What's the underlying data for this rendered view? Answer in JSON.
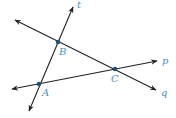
{
  "diagram": {
    "colors": {
      "line": "#222222",
      "label": "#4a8fc9",
      "point": "#1f4e7a"
    },
    "lines": [
      {
        "name": "t",
        "label": "t",
        "x1": 29,
        "y1": 111,
        "x2": 73,
        "y2": 7,
        "label_x": 77,
        "label_y": 8
      },
      {
        "name": "q",
        "label": "q",
        "x1": 15,
        "y1": 20,
        "x2": 156,
        "y2": 90,
        "label_x": 161,
        "label_y": 96
      },
      {
        "name": "p",
        "label": "p",
        "x1": 12,
        "y1": 89,
        "x2": 157,
        "y2": 61,
        "label_x": 162,
        "label_y": 64
      }
    ],
    "points": [
      {
        "name": "A",
        "label": "A",
        "x": 39,
        "y": 84,
        "label_x": 42,
        "label_y": 96
      },
      {
        "name": "B",
        "label": "B",
        "x": 58,
        "y": 42,
        "label_x": 59,
        "label_y": 55
      },
      {
        "name": "C",
        "label": "C",
        "x": 115,
        "y": 69,
        "label_x": 111,
        "label_y": 82
      }
    ]
  }
}
